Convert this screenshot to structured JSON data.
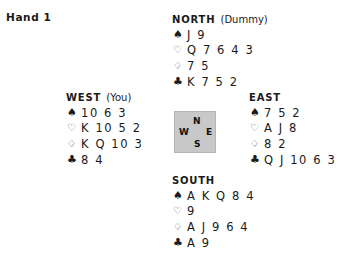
{
  "title": "Hand 1",
  "suits": {
    "spades": "♠",
    "hearts": "♡",
    "diamonds": "♢",
    "clubs": "♣"
  },
  "hands": {
    "north": {
      "seat": "NORTH",
      "role": "(Dummy)",
      "spades": "J 9",
      "hearts": "Q 7 6 4 3",
      "diamonds": "7 5",
      "clubs": "K 7 5 2"
    },
    "west": {
      "seat": "WEST",
      "role": "(You)",
      "spades": "10 6 3",
      "hearts": "K 10 5 2",
      "diamonds": "K Q 10 3",
      "clubs": "8 4"
    },
    "east": {
      "seat": "EAST",
      "role": "",
      "spades": "7 5 2",
      "hearts": "A J 8",
      "diamonds": "8 2",
      "clubs": "Q J 10 6 3"
    },
    "south": {
      "seat": "SOUTH",
      "role": "",
      "spades": "A K Q 8 4",
      "hearts": "9",
      "diamonds": "A J 9 6 4",
      "clubs": "A 9"
    }
  },
  "compass": {
    "n": "N",
    "w": "W",
    "e": "E",
    "s": "S",
    "background": "#c8c8c8"
  }
}
